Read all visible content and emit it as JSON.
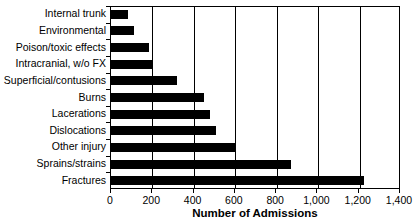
{
  "chart_data": {
    "type": "bar",
    "orientation": "horizontal",
    "title": "",
    "xlabel": "Number of Admissions",
    "ylabel": "",
    "xlim": [
      0,
      1400
    ],
    "xticks": [
      0,
      200,
      400,
      600,
      800,
      1000,
      1200,
      1400
    ],
    "xtick_labels": [
      "0",
      "200",
      "400",
      "600",
      "800",
      "1,000",
      "1,200",
      "1,400"
    ],
    "grid": "vertical",
    "legend": "none",
    "bar_color": "#000000",
    "categories": [
      "Internal trunk",
      "Environmental",
      "Poison/toxic effects",
      "Intracranial, w/o FX",
      "Superficial/contusions",
      "Burns",
      "Lacerations",
      "Dislocations",
      "Other injury",
      "Sprains/strains",
      "Fractures"
    ],
    "values": [
      80,
      110,
      185,
      200,
      320,
      450,
      480,
      510,
      600,
      870,
      1225
    ]
  }
}
